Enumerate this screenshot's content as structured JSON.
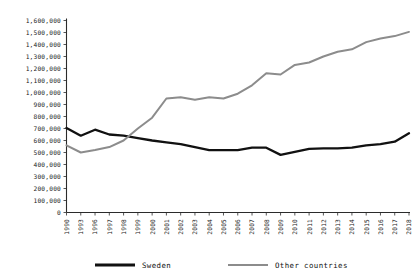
{
  "chart_data": {
    "type": "line",
    "title": "",
    "subtitle": "",
    "xlabel": "",
    "ylabel": "",
    "grid": false,
    "legend_position": "bottom",
    "ylim": [
      0,
      1600000
    ],
    "ytick_labels": [
      "1,600,000",
      "1,500,000",
      "1,400,000",
      "1,300,000",
      "1,200,000",
      "1,100,000",
      "1,000,000",
      "900,000",
      "800,000",
      "700,000",
      "600,000",
      "500,000",
      "400,000",
      "300,000",
      "200,000",
      "100,000",
      "0"
    ],
    "ytick_values": [
      1600000,
      1500000,
      1400000,
      1300000,
      1200000,
      1100000,
      1000000,
      900000,
      800000,
      700000,
      600000,
      500000,
      400000,
      300000,
      200000,
      100000,
      0
    ],
    "categories": [
      "1990",
      "1993",
      "1996",
      "1997",
      "1998",
      "1999",
      "2000",
      "2001",
      "2002",
      "2003",
      "2004",
      "2005",
      "2006",
      "2007",
      "2008",
      "2009",
      "2010",
      "2011",
      "2012",
      "2013",
      "2014",
      "2015",
      "2016",
      "2017",
      "2018"
    ],
    "xtick_labels_visible": [
      "1990",
      "1993",
      "1996",
      "1997",
      "1998",
      "1999",
      "2000",
      "2001",
      "2002",
      "2003",
      "2004",
      "2005",
      "2006",
      "2007",
      "2008",
      "2009",
      "2010",
      "2011",
      "2012",
      "2013",
      "2014",
      "2015",
      "2016",
      "2017",
      "2018"
    ],
    "series": [
      {
        "name": "Sweden",
        "color": "#111111",
        "values": [
          705000,
          640000,
          690000,
          650000,
          640000,
          620000,
          600000,
          585000,
          570000,
          545000,
          520000,
          520000,
          520000,
          540000,
          540000,
          480000,
          505000,
          530000,
          535000,
          535000,
          540000,
          560000,
          570000,
          590000,
          660000
        ]
      },
      {
        "name": "Other countries",
        "color": "#8c8c8c",
        "values": [
          560000,
          500000,
          520000,
          545000,
          600000,
          700000,
          790000,
          950000,
          960000,
          940000,
          960000,
          950000,
          990000,
          1060000,
          1160000,
          1150000,
          1230000,
          1250000,
          1300000,
          1340000,
          1360000,
          1420000,
          1450000,
          1470000,
          1505000
        ]
      }
    ],
    "legend": [
      {
        "label": "Sweden",
        "color": "#111111",
        "style": "thick-solid"
      },
      {
        "label": "Other countries",
        "color": "#8c8c8c",
        "style": "solid"
      }
    ]
  }
}
